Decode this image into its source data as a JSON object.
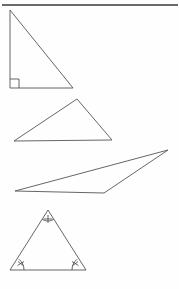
{
  "figure": {
    "title": "Four triangles",
    "background_color": "#fefefe",
    "stroke_color": "#55555a",
    "rule_color": "#3a3a3a",
    "mark_color": "#4a4a50",
    "width": 179,
    "height": 289
  },
  "chart_data": {
    "type": "diagram",
    "title": "Four triangles",
    "shapes": [
      {
        "name": "right-triangle",
        "label": "Right triangle",
        "points": "10,10 10,88 73,88",
        "vertices": [
          [
            10,
            10
          ],
          [
            10,
            88
          ],
          [
            73,
            88
          ]
        ],
        "angle_marks": [
          {
            "type": "right-angle-square",
            "at": [
              10,
              88
            ],
            "size": 9
          }
        ]
      },
      {
        "name": "acute-triangle",
        "label": "Acute triangle",
        "points": "77,99 14,141 112,140",
        "vertices": [
          [
            77,
            99
          ],
          [
            14,
            141
          ],
          [
            112,
            140
          ]
        ],
        "angle_marks": []
      },
      {
        "name": "obtuse-triangle",
        "label": "Obtuse triangle",
        "points": "168,150 15,191 104,193",
        "vertices": [
          [
            168,
            150
          ],
          [
            15,
            191
          ],
          [
            104,
            193
          ]
        ],
        "angle_marks": []
      },
      {
        "name": "isosceles-triangle",
        "label": "Isosceles triangle with marked angles",
        "points": "48,210 10,270 86,270",
        "vertices": [
          [
            48,
            210
          ],
          [
            10,
            270
          ],
          [
            86,
            270
          ]
        ],
        "angle_marks": [
          {
            "type": "arc-with-tick",
            "at": [
              48,
              210
            ],
            "tick": "cross"
          },
          {
            "type": "arc-with-tick",
            "at": [
              10,
              270
            ],
            "tick": "cross"
          },
          {
            "type": "arc-with-tick",
            "at": [
              86,
              270
            ],
            "tick": "cross"
          }
        ]
      }
    ],
    "rules": [
      {
        "name": "top-rule",
        "x1": 2,
        "y1": 5,
        "x2": 178,
        "y2": 5
      }
    ]
  }
}
